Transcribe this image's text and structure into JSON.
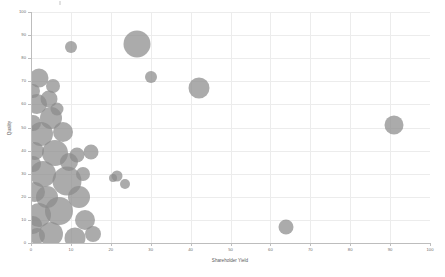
{
  "chart_data": {
    "type": "scatter",
    "title": "",
    "xlabel": "Shareholder Yield",
    "ylabel": "Quality",
    "xlim": [
      0,
      100
    ],
    "ylim": [
      0,
      100
    ],
    "xticks": [
      0,
      10,
      20,
      30,
      40,
      50,
      60,
      70,
      80,
      90,
      100
    ],
    "yticks": [
      0,
      10,
      20,
      30,
      40,
      50,
      60,
      70,
      80,
      90,
      100
    ],
    "grid": true,
    "legend": "none",
    "marker_color": "#8a8a8a",
    "marker_opacity": 0.72,
    "note": "Bubble / scatter chart. Marker area encodes a third magnitude variable. Dense overlapping cluster hugs the left axis between Shareholder Yield 0-16.",
    "points": [
      {
        "x": 10.0,
        "y": 85.0,
        "r": 6.0
      },
      {
        "x": 26.5,
        "y": 86.0,
        "r": 13.5
      },
      {
        "x": 30.0,
        "y": 72.0,
        "r": 6.0
      },
      {
        "x": 42.0,
        "y": 67.0,
        "r": 10.5
      },
      {
        "x": 91.0,
        "y": 51.0,
        "r": 9.5
      },
      {
        "x": 64.0,
        "y": 7.0,
        "r": 7.5
      },
      {
        "x": 2.0,
        "y": 71.5,
        "r": 9.5
      },
      {
        "x": 5.5,
        "y": 68.0,
        "r": 7.0
      },
      {
        "x": 4.5,
        "y": 62.5,
        "r": 8.5
      },
      {
        "x": 1.5,
        "y": 60.0,
        "r": 10.0
      },
      {
        "x": 5.0,
        "y": 54.0,
        "r": 11.0
      },
      {
        "x": 2.5,
        "y": 47.0,
        "r": 12.0
      },
      {
        "x": 11.5,
        "y": 38.0,
        "r": 7.5
      },
      {
        "x": 15.0,
        "y": 39.5,
        "r": 7.5
      },
      {
        "x": 6.0,
        "y": 39.0,
        "r": 13.0
      },
      {
        "x": 21.5,
        "y": 29.0,
        "r": 5.5
      },
      {
        "x": 23.5,
        "y": 25.5,
        "r": 5.0
      },
      {
        "x": 20.5,
        "y": 28.0,
        "r": 4.0
      },
      {
        "x": 9.0,
        "y": 27.0,
        "r": 14.5
      },
      {
        "x": 3.0,
        "y": 30.0,
        "r": 13.0
      },
      {
        "x": 7.0,
        "y": 14.0,
        "r": 14.0
      },
      {
        "x": 13.5,
        "y": 10.0,
        "r": 10.0
      },
      {
        "x": 2.0,
        "y": 12.0,
        "r": 12.0
      },
      {
        "x": 5.0,
        "y": 4.0,
        "r": 12.0
      },
      {
        "x": 11.0,
        "y": 2.0,
        "r": 10.5
      },
      {
        "x": 1.0,
        "y": 40.0,
        "r": 9.0
      },
      {
        "x": 1.0,
        "y": 22.0,
        "r": 10.0
      },
      {
        "x": 0.5,
        "y": 52.0,
        "r": 8.0
      },
      {
        "x": 0.5,
        "y": 66.0,
        "r": 7.0
      },
      {
        "x": 8.0,
        "y": 48.0,
        "r": 10.0
      },
      {
        "x": 12.0,
        "y": 20.0,
        "r": 11.0
      },
      {
        "x": 15.5,
        "y": 4.0,
        "r": 8.0
      },
      {
        "x": 0.5,
        "y": 34.0,
        "r": 8.0
      },
      {
        "x": 0.5,
        "y": 8.0,
        "r": 9.0
      },
      {
        "x": 4.0,
        "y": 20.0,
        "r": 11.0
      },
      {
        "x": 9.5,
        "y": 35.0,
        "r": 9.0
      },
      {
        "x": 6.5,
        "y": 58.0,
        "r": 6.5
      },
      {
        "x": 1.5,
        "y": 3.0,
        "r": 8.0
      },
      {
        "x": 13.0,
        "y": 30.0,
        "r": 7.0
      }
    ]
  }
}
